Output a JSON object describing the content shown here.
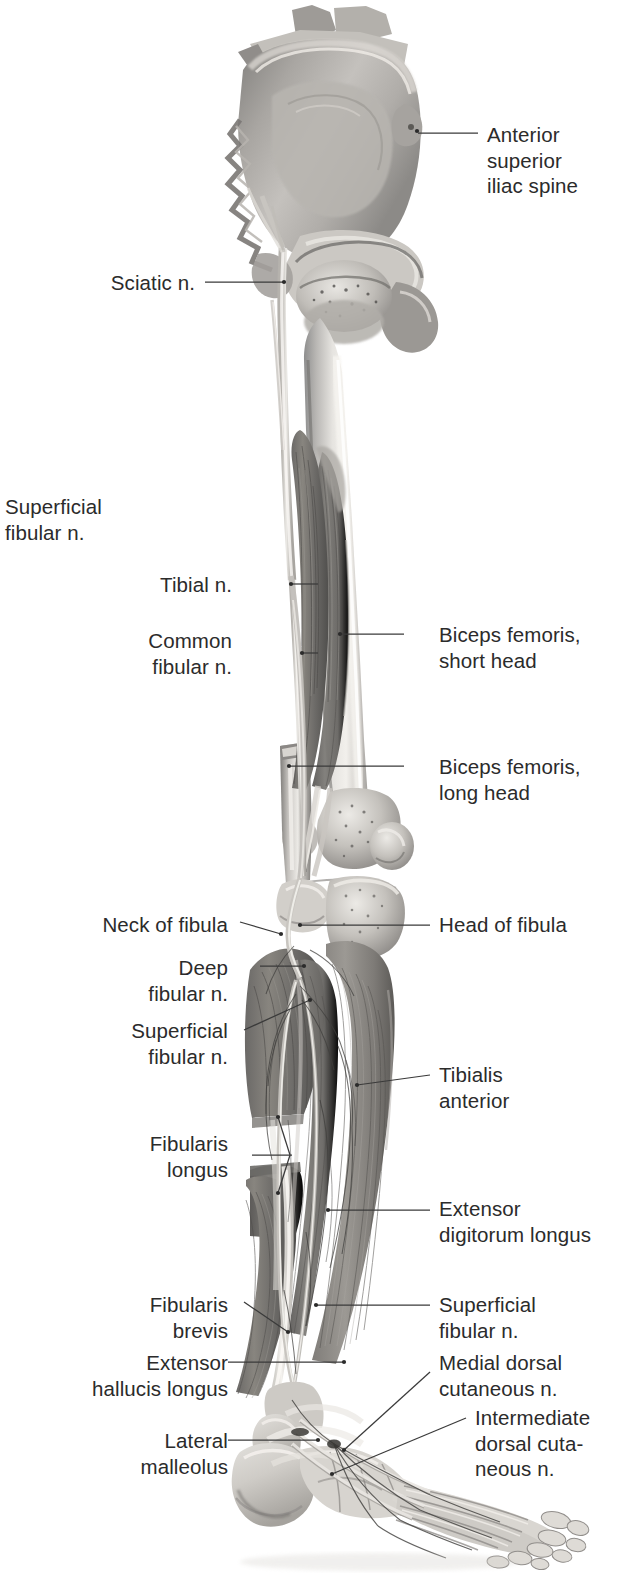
{
  "figure": {
    "view": "lateral / anterolateral view of right lower limb",
    "style": "grayscale anatomical illustration",
    "background_color": "#ffffff",
    "text_color": "#2b2b2b",
    "leader_color": "#3a3a3a"
  },
  "labels": [
    {
      "id": "anterior-superior-iliac-spine",
      "text": "Anterior\nsuperior\niliac spine",
      "side": "right",
      "x": 487,
      "y": 122,
      "lines": 3
    },
    {
      "id": "sciatic-n",
      "text": "Sciatic n.",
      "side": "right-aligned-left",
      "x": 195,
      "y": 270,
      "lines": 1
    },
    {
      "id": "superficial-fibular-n-upper",
      "text": "Superficial\nfibular n.",
      "side": "left-free",
      "x": 5,
      "y": 494,
      "lines": 2
    },
    {
      "id": "tibial-n",
      "text": "Tibial n.",
      "side": "right-aligned-left",
      "x": 232,
      "y": 572,
      "lines": 1
    },
    {
      "id": "common-fibular-n",
      "text": "Common\nfibular n.",
      "side": "right-aligned-left",
      "x": 232,
      "y": 628,
      "lines": 2
    },
    {
      "id": "biceps-femoris-short-head",
      "text": "Biceps femoris,\nshort head",
      "side": "right",
      "x": 439,
      "y": 622,
      "lines": 2
    },
    {
      "id": "biceps-femoris-long-head",
      "text": "Biceps femoris,\nlong head",
      "side": "right",
      "x": 439,
      "y": 754,
      "lines": 2
    },
    {
      "id": "neck-of-fibula",
      "text": "Neck of fibula",
      "side": "right-aligned-left",
      "x": 228,
      "y": 912,
      "lines": 1
    },
    {
      "id": "head-of-fibula",
      "text": "Head of fibula",
      "side": "right",
      "x": 439,
      "y": 912,
      "lines": 1
    },
    {
      "id": "deep-fibular-n",
      "text": "Deep\nfibular n.",
      "side": "right-aligned-left",
      "x": 228,
      "y": 955,
      "lines": 2
    },
    {
      "id": "superficial-fibular-n-leg",
      "text": "Superficial\nfibular n.",
      "side": "right-aligned-left",
      "x": 228,
      "y": 1018,
      "lines": 2
    },
    {
      "id": "tibialis-anterior",
      "text": "Tibialis\nanterior",
      "side": "right",
      "x": 439,
      "y": 1062,
      "lines": 2
    },
    {
      "id": "fibularis-longus",
      "text": "Fibularis\nlongus",
      "side": "right-aligned-left",
      "x": 228,
      "y": 1131,
      "lines": 2
    },
    {
      "id": "extensor-digitorum-longus",
      "text": "Extensor\ndigitorum longus",
      "side": "right",
      "x": 439,
      "y": 1196,
      "lines": 2
    },
    {
      "id": "fibularis-brevis",
      "text": "Fibularis\nbrevis",
      "side": "right-aligned-left",
      "x": 228,
      "y": 1292,
      "lines": 2
    },
    {
      "id": "superficial-fibular-n-ankle",
      "text": "Superficial\nfibular n.",
      "side": "right",
      "x": 439,
      "y": 1292,
      "lines": 2
    },
    {
      "id": "extensor-hallucis-longus",
      "text": "Extensor\nhallucis longus",
      "side": "right-aligned-left",
      "x": 214,
      "y": 1350,
      "lines": 2
    },
    {
      "id": "medial-dorsal-cutaneous-n",
      "text": "Medial dorsal\ncutaneous n.",
      "side": "right",
      "x": 439,
      "y": 1350,
      "lines": 2
    },
    {
      "id": "intermediate-dorsal-cutaneous-n",
      "text": "Intermediate\ndorsal cuta-\nneous n.",
      "side": "right",
      "x": 475,
      "y": 1405,
      "lines": 3
    },
    {
      "id": "lateral-malleolus",
      "text": "Lateral\nmalleolus",
      "side": "right-aligned-left",
      "x": 214,
      "y": 1428,
      "lines": 2
    }
  ],
  "structures": {
    "bones": [
      "ilium",
      "sacrum",
      "hip joint / acetabulum",
      "femur",
      "patella",
      "lateral femoral condyle",
      "head of fibula",
      "neck of fibula",
      "fibula",
      "tibia",
      "lateral malleolus",
      "tarsal bones",
      "metatarsals",
      "phalanges"
    ],
    "muscles": [
      "biceps femoris long head",
      "biceps femoris short head",
      "tibialis anterior",
      "fibularis longus",
      "fibularis brevis",
      "extensor digitorum longus",
      "extensor hallucis longus"
    ],
    "nerves": [
      "sciatic n.",
      "tibial n.",
      "common fibular n.",
      "deep fibular n.",
      "superficial fibular n.",
      "medial dorsal cutaneous n.",
      "intermediate dorsal cutaneous n."
    ]
  }
}
